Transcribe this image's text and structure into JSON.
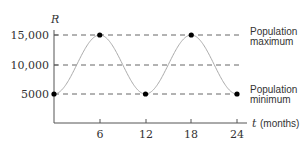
{
  "chart_data": {
    "type": "line",
    "title": "",
    "xlabel": "t (months)",
    "xlabel_var": "t",
    "xlabel_unit": "(months)",
    "ylabel": "R",
    "x_ticks": [
      6,
      12,
      18,
      24
    ],
    "x_tick_labels": [
      "6",
      "12",
      "18",
      "24"
    ],
    "y_ticks": [
      5000,
      10000,
      15000
    ],
    "y_tick_labels": [
      "5000",
      "10,000",
      "15,000"
    ],
    "xlim": [
      0,
      24
    ],
    "ylim": [
      0,
      15000
    ],
    "series": [
      {
        "name": "R(t)",
        "function": "10000 - 5000*cos(pi*t/6)",
        "x": [
          0,
          6,
          12,
          18,
          24
        ],
        "values": [
          5000,
          15000,
          5000,
          15000,
          5000
        ]
      }
    ],
    "marked_points": [
      {
        "t": 0,
        "R": 5000
      },
      {
        "t": 6,
        "R": 15000
      },
      {
        "t": 12,
        "R": 5000
      },
      {
        "t": 18,
        "R": 15000
      },
      {
        "t": 24,
        "R": 5000
      }
    ],
    "reference_lines": [
      {
        "y": 15000,
        "style": "dashed"
      },
      {
        "y": 10000,
        "style": "dashed"
      },
      {
        "y": 5000,
        "style": "dashed"
      }
    ],
    "annotations": [
      {
        "text_line1": "Population",
        "text_line2": "maximum",
        "at_y": 15000
      },
      {
        "text_line1": "Population",
        "text_line2": "minimum",
        "at_y": 5000
      }
    ],
    "grid": false,
    "legend": "none"
  }
}
